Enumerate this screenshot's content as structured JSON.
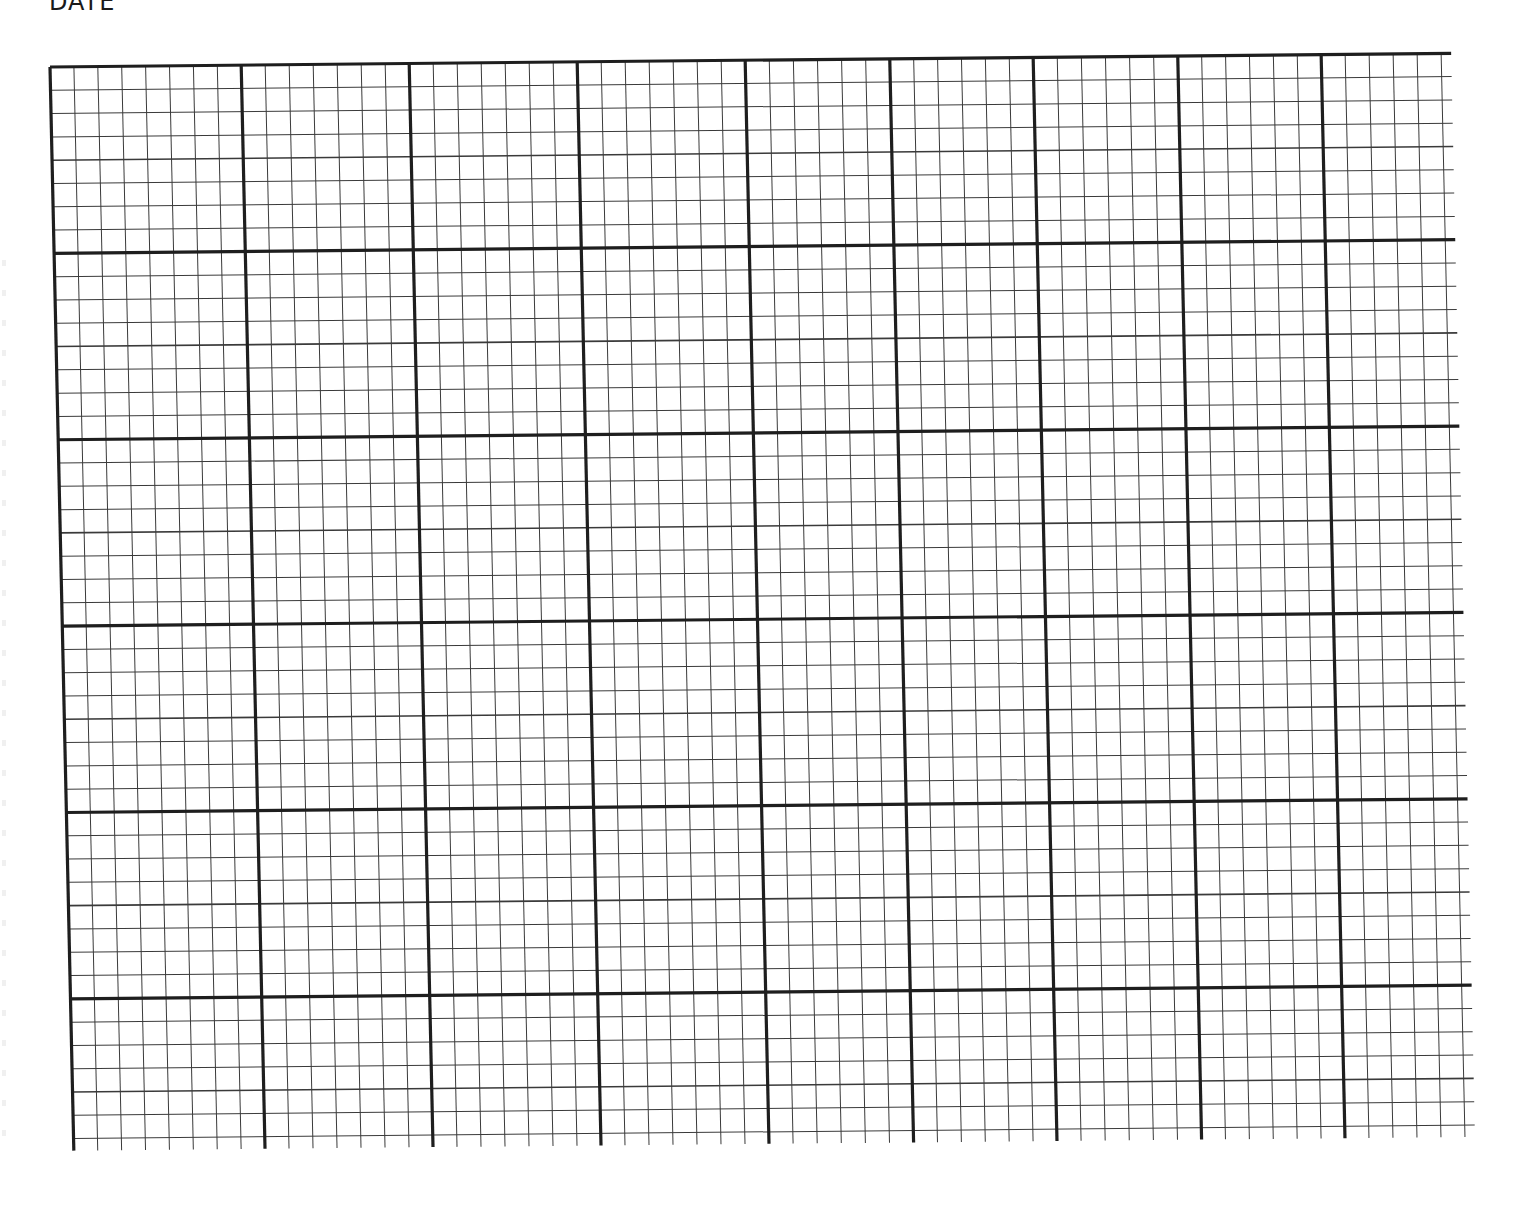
{
  "page": {
    "header_label": "DATE",
    "type": "graph-paper"
  },
  "grid": {
    "line_color": "#1e1e1e",
    "minor_line_color": "#3a3a3a",
    "major_stroke": 3.2,
    "half_stroke": 1.6,
    "minor_stroke": 1.0,
    "minor_cell_px": 24,
    "row_minor_px": 23.3,
    "columns": [
      {
        "minors": 8,
        "minor_px": 23.9
      },
      {
        "minors": 7,
        "minor_px": 24.0
      },
      {
        "minors": 7,
        "minor_px": 24.0
      },
      {
        "minors": 7,
        "minor_px": 24.0
      },
      {
        "minors": 6,
        "minor_px": 24.1
      },
      {
        "minors": 6,
        "minor_px": 23.9
      },
      {
        "minors": 6,
        "minor_px": 24.1
      },
      {
        "minors": 6,
        "minor_px": 23.9
      },
      {
        "minors": 5,
        "minor_px": 24.0,
        "partial_extra_px": 10
      }
    ],
    "major_rows": 6,
    "minors_per_row": 8,
    "last_row_minors": 7,
    "bottom_stub_px": 12,
    "right_stub_px": 10
  }
}
